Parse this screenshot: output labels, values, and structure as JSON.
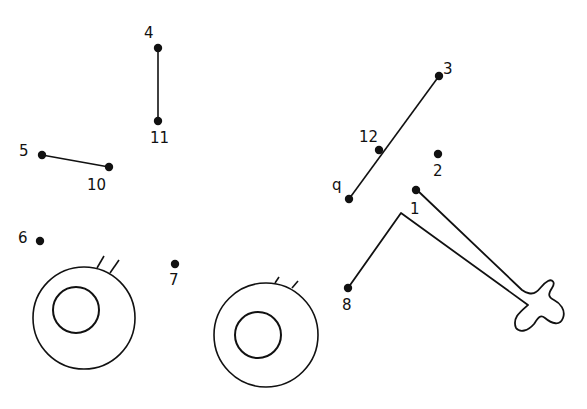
{
  "puzzle": {
    "type": "connect-the-dots",
    "dots": [
      {
        "n": "1",
        "x": 416,
        "y": 190,
        "lx": 410,
        "ly": 214
      },
      {
        "n": "2",
        "x": 438,
        "y": 154,
        "lx": 433,
        "ly": 176
      },
      {
        "n": "3",
        "x": 439,
        "y": 76,
        "lx": 443,
        "ly": 74
      },
      {
        "n": "4",
        "x": 158,
        "y": 48,
        "lx": 144,
        "ly": 38
      },
      {
        "n": "5",
        "x": 42,
        "y": 155,
        "lx": 19,
        "ly": 156
      },
      {
        "n": "6",
        "x": 40,
        "y": 241,
        "lx": 18,
        "ly": 243
      },
      {
        "n": "7",
        "x": 175,
        "y": 264,
        "lx": 169,
        "ly": 285
      },
      {
        "n": "8",
        "x": 348,
        "y": 288,
        "lx": 342,
        "ly": 310
      },
      {
        "n": "q",
        "x": 349,
        "y": 199,
        "lx": 332,
        "ly": 190
      },
      {
        "n": "10",
        "x": 109,
        "y": 167,
        "lx": 87,
        "ly": 190
      },
      {
        "n": "11",
        "x": 158,
        "y": 121,
        "lx": 150,
        "ly": 143
      },
      {
        "n": "12",
        "x": 379,
        "y": 150,
        "lx": 359,
        "ly": 142
      }
    ],
    "segments": [
      {
        "from": "4",
        "to": "11"
      },
      {
        "from": "5",
        "to": "10"
      },
      {
        "from": "3",
        "to": "q"
      }
    ],
    "wheels": [
      {
        "cx": 84,
        "cy": 318,
        "r": 51,
        "icx": 76,
        "icy": 310,
        "ir": 23
      },
      {
        "cx": 266,
        "cy": 335,
        "r": 52,
        "icx": 258,
        "icy": 335,
        "ir": 23
      }
    ],
    "stroke_color": "#111111",
    "background_color": "#ffffff"
  }
}
